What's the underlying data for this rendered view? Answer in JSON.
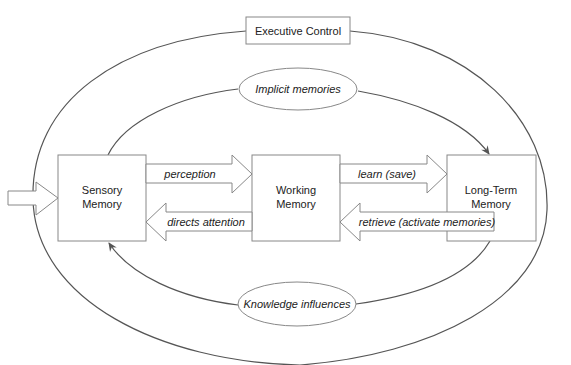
{
  "diagram": {
    "boxes": {
      "sensory": {
        "line1": "Sensory",
        "line2": "Memory"
      },
      "working": {
        "line1": "Working",
        "line2": "Memory"
      },
      "long_term": {
        "line1": "Long-Term",
        "line2": "Memory"
      },
      "executive": {
        "label": "Executive Control"
      }
    },
    "ellipses": {
      "implicit": {
        "label": "Implicit memories"
      },
      "knowledge": {
        "label": "Knowledge influences"
      }
    },
    "arrows": {
      "perception": {
        "label": "perception"
      },
      "directs_attention": {
        "label": "directs attention"
      },
      "learn": {
        "label": "learn (save)"
      },
      "retrieve": {
        "label": "retrieve (activate memories)"
      }
    },
    "colors": {
      "stroke": "#555555",
      "box_stroke": "#888888",
      "text": "#222222",
      "background": "#ffffff"
    }
  }
}
